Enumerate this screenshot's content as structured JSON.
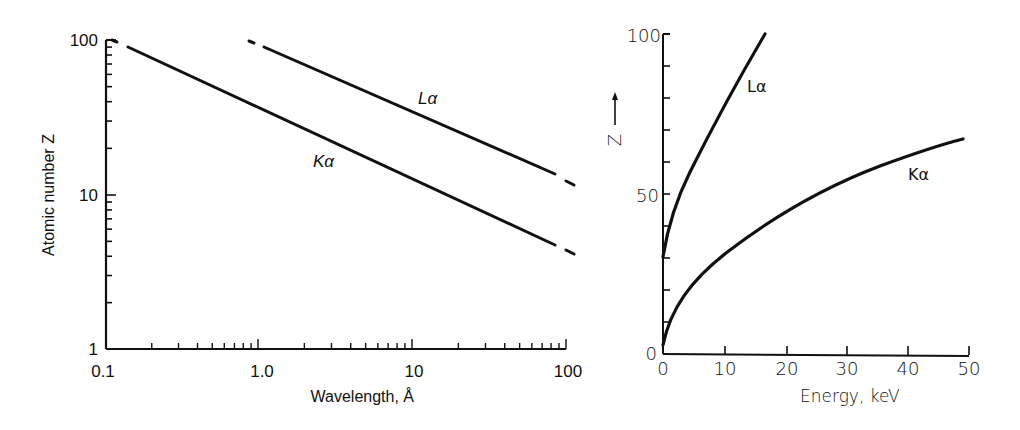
{
  "chart_data": [
    {
      "type": "line",
      "title": "",
      "xlabel": "Wavelength, Å",
      "ylabel": "Atomic number Z",
      "xscale": "log",
      "yscale": "log",
      "xlim": [
        0.1,
        100
      ],
      "ylim": [
        1,
        100
      ],
      "x_tick_labels": [
        "0.1",
        "1.0",
        "10",
        "100"
      ],
      "y_tick_labels": [
        "1",
        "10",
        "100"
      ],
      "grid": false,
      "legend": "inline labels",
      "series": [
        {
          "name": "Kα",
          "x": [
            0.13,
            1.0,
            10,
            80,
            100
          ],
          "y": [
            90,
            38,
            14,
            4.8,
            4.2
          ]
        },
        {
          "name": "Lα",
          "x": [
            0.85,
            1.1,
            10,
            80,
            100
          ],
          "y": [
            100,
            95,
            34,
            14,
            12.5
          ]
        }
      ]
    },
    {
      "type": "line",
      "title": "",
      "xlabel": "Energy, keV",
      "ylabel": "Z",
      "xlim": [
        0,
        50
      ],
      "ylim": [
        0,
        100
      ],
      "x_tick_labels": [
        "0",
        "10",
        "20",
        "30",
        "40",
        "50"
      ],
      "y_tick_labels": [
        "0",
        "50",
        "100"
      ],
      "grid": false,
      "legend": "inline labels",
      "series": [
        {
          "name": "Lα",
          "x": [
            0,
            1,
            2,
            4,
            6,
            8,
            10,
            12,
            14,
            16.7
          ],
          "y": [
            30,
            38,
            44,
            55,
            63,
            71,
            78,
            85,
            91,
            100
          ]
        },
        {
          "name": "Kα",
          "x": [
            0,
            1,
            2.5,
            5,
            10,
            15,
            20,
            25,
            30,
            35,
            40,
            45,
            49
          ],
          "y": [
            3,
            12,
            18,
            25,
            35,
            42,
            48,
            52,
            56,
            59,
            62,
            65,
            67
          ]
        }
      ]
    }
  ],
  "left": {
    "ylabel": "Atomic number Z",
    "xlabel": "Wavelength, Å",
    "yticks": [
      "100",
      "10",
      "1"
    ],
    "xticks": [
      "0.1",
      "1.0",
      "10",
      "100"
    ],
    "label_ka": "Kα",
    "label_la": "Lα"
  },
  "right": {
    "ylabel": "Z",
    "arrow": "⟶",
    "xlabel": "Energy, keV",
    "yticks": [
      "100",
      "50",
      "0"
    ],
    "xticks": [
      "0",
      "10",
      "20",
      "30",
      "40",
      "50"
    ],
    "label_la": "Lα",
    "label_ka": "Kα"
  }
}
